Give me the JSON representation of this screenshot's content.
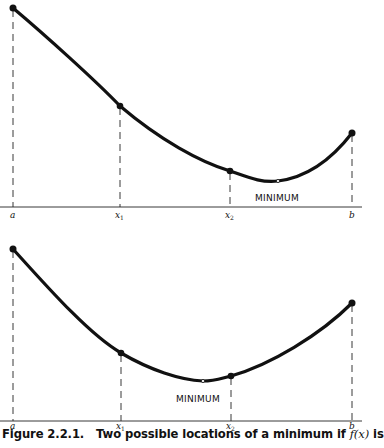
{
  "figure": {
    "caption_label": "Figure 2.2.1.",
    "caption_text": "Two possible locations of a minimum if",
    "caption_fx": "f(x)",
    "caption_tail": "is"
  },
  "panels": [
    {
      "name": "top-panel",
      "labels": {
        "a": "a",
        "x1": "x",
        "x1_sub": "1",
        "x2": "x",
        "x2_sub": "2",
        "b": "b",
        "minimum": "MINIMUM"
      },
      "points": {
        "a": [
          13,
          8
        ],
        "x1": [
          120,
          106
        ],
        "x2": [
          230,
          171
        ],
        "min": [
          278,
          181
        ],
        "b": [
          352,
          133
        ]
      },
      "axis_y": 207
    },
    {
      "name": "bottom-panel",
      "labels": {
        "a": "a",
        "x1": "x",
        "x1_sub": "1",
        "x2": "x",
        "x2_sub": "2",
        "b": "b",
        "minimum": "MINIMUM"
      },
      "points": {
        "a": [
          13,
          249
        ],
        "x1": [
          121,
          353
        ],
        "min": [
          203,
          381
        ],
        "x2": [
          231,
          376
        ],
        "b": [
          352,
          303
        ]
      },
      "axis_y": 421
    }
  ],
  "colors": {
    "ink": "#111111",
    "background": "#ffffff"
  }
}
